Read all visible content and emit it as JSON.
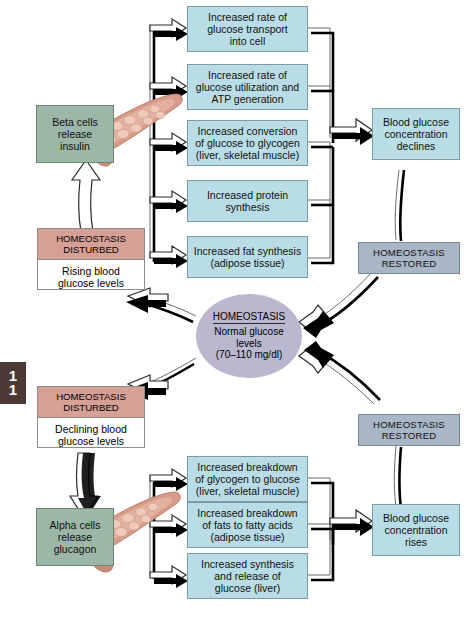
{
  "figure": {
    "chapter_marker": "11",
    "caption": ""
  },
  "colors": {
    "effector_box": "#b9dde6",
    "cell_box": "#9db7a6",
    "restored_box": "#a9b6c6",
    "disturbed_header": "#d7a096",
    "homeostasis_oval": "#b9b8ce",
    "chapter_tab": "#4a3a33",
    "pancreas": "#d99f8c"
  },
  "center": {
    "title": "HOMEOSTASIS",
    "line1": "Normal glucose",
    "line2": "levels",
    "line3": "(70–110 mg/dl)"
  },
  "insulin_pathway": {
    "disturbed": {
      "header_line1": "HOMEOSTASIS",
      "header_line2": "DISTURBED",
      "body_line1": "Rising blood",
      "body_line2": "glucose levels"
    },
    "cell_box": {
      "line1": "Beta cells",
      "line2": "release",
      "line3": "insulin"
    },
    "effects": [
      {
        "lines": [
          "Increased rate of",
          "glucose transport",
          "into cell"
        ]
      },
      {
        "lines": [
          "Increased rate of",
          "glucose utilization and",
          "ATP generation"
        ]
      },
      {
        "lines": [
          "Increased conversion",
          "of glucose to glycogen",
          "(liver, skeletal muscle)"
        ]
      },
      {
        "lines": [
          "Increased protein",
          "synthesis"
        ]
      },
      {
        "lines": [
          "Increased fat synthesis",
          "(adipose tissue)"
        ]
      }
    ],
    "outcome": {
      "line1": "Blood glucose",
      "line2": "concentration",
      "line3": "declines"
    },
    "restored": {
      "line1": "HOMEOSTASIS",
      "line2": "RESTORED"
    }
  },
  "glucagon_pathway": {
    "disturbed": {
      "header_line1": "HOMEOSTASIS",
      "header_line2": "DISTURBED",
      "body_line1": "Declining blood",
      "body_line2": "glucose levels"
    },
    "cell_box": {
      "line1": "Alpha cells",
      "line2": "release",
      "line3": "glucagon"
    },
    "effects": [
      {
        "lines": [
          "Increased breakdown",
          "of glycogen to glucose",
          "(liver, skeletal muscle)"
        ]
      },
      {
        "lines": [
          "Increased breakdown",
          "of fats to fatty acids",
          "(adipose tissue)"
        ]
      },
      {
        "lines": [
          "Increased synthesis",
          "and release of",
          "glucose (liver)"
        ]
      }
    ],
    "outcome": {
      "line1": "Blood glucose",
      "line2": "concentration",
      "line3": "rises"
    },
    "restored": {
      "line1": "HOMEOSTASIS",
      "line2": "RESTORED"
    }
  }
}
